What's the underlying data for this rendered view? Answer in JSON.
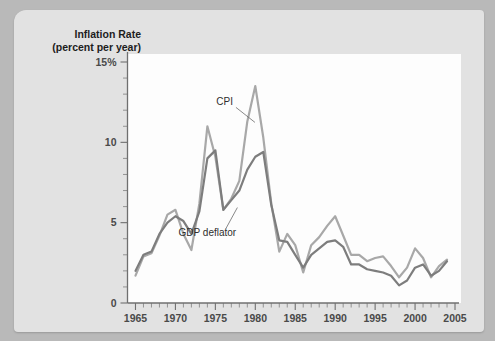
{
  "chart_data": {
    "type": "line",
    "title": "Inflation Rate",
    "subtitle": "(percent per year)",
    "xlabel": "",
    "ylabel": "Inflation Rate (percent per year)",
    "xlim": [
      1964,
      2005
    ],
    "ylim": [
      0,
      15
    ],
    "grid": false,
    "legend_position": "inline-annotation",
    "y_ticks": [
      "0",
      "5",
      "10",
      "15%"
    ],
    "y_tick_values": [
      0,
      5,
      10,
      15
    ],
    "y_minor_step": 1,
    "x_ticks": [
      "1965",
      "1970",
      "1975",
      "1980",
      "1985",
      "1990",
      "1995",
      "2000",
      "2005"
    ],
    "x_tick_values": [
      1965,
      1970,
      1975,
      1980,
      1985,
      1990,
      1995,
      2000,
      2005
    ],
    "x_minor_step": 1,
    "x": [
      1965,
      1966,
      1967,
      1968,
      1969,
      1970,
      1971,
      1972,
      1973,
      1974,
      1975,
      1976,
      1977,
      1978,
      1979,
      1980,
      1981,
      1982,
      1983,
      1984,
      1985,
      1986,
      1987,
      1988,
      1989,
      1990,
      1991,
      1992,
      1993,
      1994,
      1995,
      1996,
      1997,
      1998,
      1999,
      2000,
      2001,
      2002,
      2003,
      2004
    ],
    "series": [
      {
        "name": "CPI",
        "color": "#a8a8a8",
        "values": [
          1.7,
          2.9,
          3.1,
          4.2,
          5.5,
          5.8,
          4.3,
          3.3,
          6.2,
          11.0,
          9.1,
          5.8,
          6.5,
          7.6,
          11.3,
          13.5,
          10.3,
          6.2,
          3.2,
          4.3,
          3.6,
          1.9,
          3.6,
          4.1,
          4.8,
          5.4,
          4.2,
          3.0,
          3.0,
          2.6,
          2.8,
          2.9,
          2.3,
          1.6,
          2.2,
          3.4,
          2.8,
          1.6,
          2.3,
          2.7
        ]
      },
      {
        "name": "GDP deflator",
        "color": "#7d7d7d",
        "values": [
          2.0,
          3.0,
          3.2,
          4.3,
          5.0,
          5.4,
          5.1,
          4.3,
          5.7,
          9.0,
          9.5,
          5.8,
          6.4,
          7.0,
          8.3,
          9.1,
          9.4,
          6.1,
          3.9,
          3.8,
          3.0,
          2.2,
          3.0,
          3.4,
          3.8,
          3.9,
          3.5,
          2.4,
          2.4,
          2.1,
          2.0,
          1.9,
          1.7,
          1.1,
          1.4,
          2.2,
          2.4,
          1.7,
          2.0,
          2.6
        ]
      }
    ],
    "annotations": [
      {
        "label": "CPI",
        "x": 1977.2,
        "y": 12.3
      },
      {
        "label": "GDP deflator",
        "x": 1974.0,
        "y": 4.2
      }
    ]
  }
}
